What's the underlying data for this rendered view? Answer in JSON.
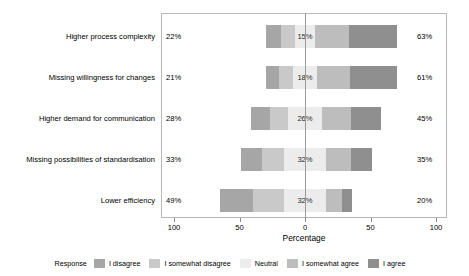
{
  "chart_data": {
    "type": "bar",
    "subtype": "diverging-stacked-likert",
    "title": "",
    "xlabel": "Percentage",
    "ylabel": "",
    "grid": false,
    "legend_position": "bottom",
    "legend_title": "Response",
    "xlim": [
      -100,
      100
    ],
    "tick_labels": [
      "100",
      "50",
      "0",
      "50",
      "100"
    ],
    "tick_values": [
      -100,
      -50,
      0,
      50,
      100
    ],
    "categories": [
      "Higher process complexity",
      "Missing willingness for changes",
      "Higher demand for communication",
      "Missing possibilities of standardisation",
      "Lower efficiency"
    ],
    "series": [
      {
        "name": "I disagree",
        "color": "#a6a6a6",
        "values": [
          11,
          10,
          14,
          16,
          25
        ]
      },
      {
        "name": "I somewhat disagree",
        "color": "#c9c9c9",
        "values": [
          11,
          11,
          14,
          17,
          24
        ]
      },
      {
        "name": "Neutral",
        "color": "#ececec",
        "values": [
          15,
          18,
          26,
          32,
          32
        ]
      },
      {
        "name": "I somewhat agree",
        "color": "#bdbdbd",
        "values": [
          26,
          25,
          22,
          19,
          12
        ]
      },
      {
        "name": "I agree",
        "color": "#8f8f8f",
        "values": [
          37,
          36,
          23,
          16,
          8
        ]
      }
    ],
    "left_totals": [
      "22%",
      "21%",
      "28%",
      "33%",
      "49%"
    ],
    "neutral_labels": [
      "15%",
      "18%",
      "26%",
      "32%",
      "32%"
    ],
    "right_totals": [
      "63%",
      "61%",
      "45%",
      "35%",
      "20%"
    ]
  },
  "axis": {
    "title": "Percentage",
    "ticks": [
      {
        "label": "100"
      },
      {
        "label": "50"
      },
      {
        "label": "0"
      },
      {
        "label": "50"
      },
      {
        "label": "100"
      }
    ]
  },
  "legend": {
    "title": "Response",
    "items": [
      {
        "label": "I disagree"
      },
      {
        "label": "I somewhat disagree"
      },
      {
        "label": "Neutral"
      },
      {
        "label": "I somewhat agree"
      },
      {
        "label": "I agree"
      }
    ]
  },
  "colors": {
    "disagree": "#a6a6a6",
    "somewhat_disagree": "#c9c9c9",
    "neutral": "#ececec",
    "somewhat_agree": "#bdbdbd",
    "agree": "#8f8f8f",
    "frame": "#b9b9b9",
    "axis": "#8c8c8c",
    "background": "#ffffff"
  }
}
